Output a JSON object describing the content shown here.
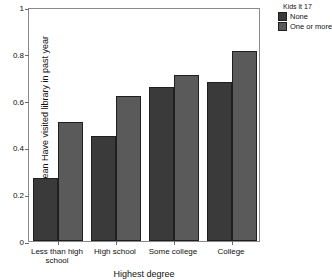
{
  "chart_data": {
    "type": "bar",
    "title": "",
    "xlabel": "Highest degree",
    "ylabel": "Mean Have visited library in past year",
    "categories": [
      "Less than high school",
      "High school",
      "Some college",
      "College"
    ],
    "series": [
      {
        "name": "None",
        "color": "#3a3a3a",
        "values": [
          0.27,
          0.45,
          0.66,
          0.68
        ]
      },
      {
        "name": "One or more",
        "color": "#5a5a5a",
        "values": [
          0.51,
          0.62,
          0.71,
          0.81
        ]
      }
    ],
    "ylim": [
      0,
      1
    ],
    "yticks": [
      "0",
      "0.2",
      "0.4",
      "0.6",
      "0.8",
      "1"
    ],
    "ytick_values": [
      0,
      0.2,
      0.4,
      0.6,
      0.8,
      1
    ],
    "grid": false,
    "legend": {
      "title": "Kids lt 17",
      "position": "top-right",
      "entries": [
        {
          "label": "None",
          "color": "#3a3a3a"
        },
        {
          "label": "One or more",
          "color": "#5a5a5a"
        }
      ]
    }
  },
  "axis": {
    "y_title": "Mean Have visited library in past year",
    "x_title": "Highest degree"
  }
}
